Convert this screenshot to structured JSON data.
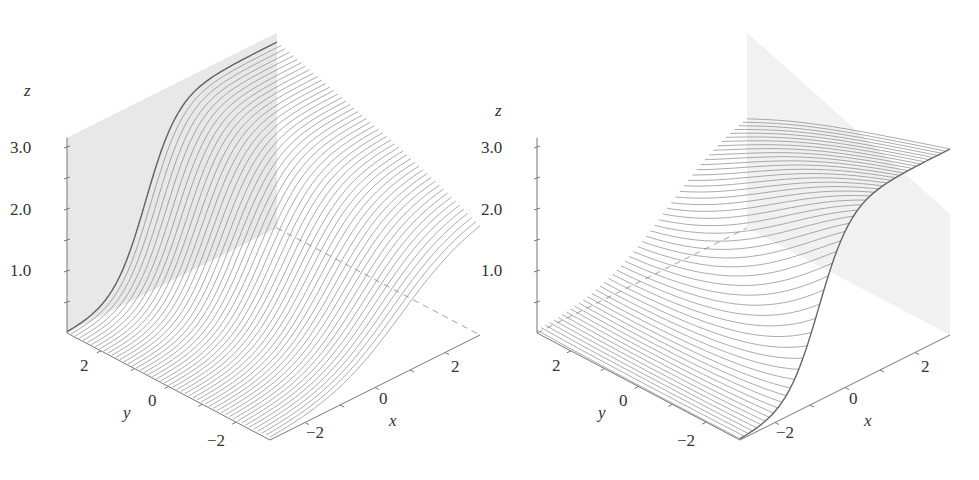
{
  "chart_data": [
    {
      "type": "surface",
      "title": "",
      "view": "left",
      "xlabel": "x",
      "ylabel": "y",
      "zlabel": "z",
      "x_ticks": [
        "-2",
        "0",
        "2"
      ],
      "y_ticks": [
        "2",
        "0",
        "-2"
      ],
      "z_ticks": [
        "1.0",
        "2.0",
        "3.0"
      ],
      "x_range": [
        -3,
        3
      ],
      "y_range": [
        -3,
        3
      ],
      "z_range": [
        0,
        3.2
      ],
      "surface": "sigmoid rising toward y = +3 (back wall), z from ~0 to ~3",
      "grid": false,
      "line_color": "#888888",
      "wall_color": "#e4e4e4",
      "num_curves": 50
    },
    {
      "type": "surface",
      "title": "",
      "view": "right",
      "xlabel": "x",
      "ylabel": "y",
      "zlabel": "z",
      "x_ticks": [
        "-2",
        "0",
        "2"
      ],
      "y_ticks": [
        "2",
        "0",
        "-2"
      ],
      "z_ticks": [
        "1.0",
        "2.0",
        "3.0"
      ],
      "x_range": [
        -3,
        3
      ],
      "y_range": [
        -3,
        3
      ],
      "z_range": [
        0,
        3.2
      ],
      "surface": "sigmoid rising toward x = +3 (right back wall), z from ~0 to ~3",
      "grid": false,
      "line_color": "#888888",
      "wall_color": "#e8e8e8",
      "num_curves": 50
    }
  ],
  "plots": [
    {
      "id": "left",
      "z_label": "z",
      "y_label": "y",
      "x_label": "x",
      "z_ticks": [
        {
          "label": "3.0",
          "y": 147
        },
        {
          "label": "2.0",
          "y": 209
        },
        {
          "label": "1.0",
          "y": 270
        }
      ],
      "y_ticks": [
        {
          "label": "2",
          "t": 0.17
        },
        {
          "label": "0",
          "t": 0.5
        },
        {
          "label": "−2",
          "t": 0.83
        }
      ],
      "x_ticks": [
        {
          "label": "−2",
          "t": 0.17
        },
        {
          "label": "0",
          "t": 0.5
        },
        {
          "label": "2",
          "t": 0.83
        }
      ]
    },
    {
      "id": "right",
      "z_label": "z",
      "y_label": "y",
      "x_label": "x",
      "z_ticks": [
        {
          "label": "3.0",
          "y": 147
        },
        {
          "label": "2.0",
          "y": 209
        },
        {
          "label": "1.0",
          "y": 270
        }
      ],
      "y_ticks": [
        {
          "label": "2",
          "t": 0.17
        },
        {
          "label": "0",
          "t": 0.5
        },
        {
          "label": "−2",
          "t": 0.83
        }
      ],
      "x_ticks": [
        {
          "label": "−2",
          "t": 0.17
        },
        {
          "label": "0",
          "t": 0.5
        },
        {
          "label": "2",
          "t": 0.83
        }
      ]
    }
  ]
}
